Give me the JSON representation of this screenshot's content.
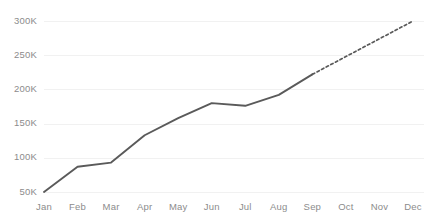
{
  "chart_data": {
    "type": "line",
    "title": "",
    "subtitle": "",
    "xlabel": "",
    "ylabel": "",
    "grid": true,
    "legend": "none",
    "categories": [
      "Jan",
      "Feb",
      "Mar",
      "Apr",
      "May",
      "Jun",
      "Jul",
      "Aug",
      "Sep",
      "Oct",
      "Nov",
      "Dec"
    ],
    "ylim": [
      50000,
      300000
    ],
    "y_ticks": [
      50000,
      100000,
      150000,
      200000,
      250000,
      300000
    ],
    "y_tick_labels": [
      "50K",
      "100K",
      "150K",
      "200K",
      "250K",
      "300K"
    ],
    "x_tick_labels": [
      "Jan",
      "Feb",
      "Mar",
      "Apr",
      "May",
      "Jun",
      "Jul",
      "Aug",
      "Sep",
      "Oct",
      "Nov",
      "Dec"
    ],
    "series": [
      {
        "name": "Actual",
        "style": "solid",
        "color": "#5a5a5a",
        "x": [
          "Jan",
          "Feb",
          "Mar",
          "Apr",
          "May",
          "Jun",
          "Jul",
          "Aug",
          "Sep"
        ],
        "values": [
          50000,
          87000,
          93000,
          133000,
          158000,
          180000,
          176000,
          192000,
          222000
        ]
      },
      {
        "name": "Forecast",
        "style": "dashed",
        "color": "#5a5a5a",
        "x": [
          "Sep",
          "Oct",
          "Nov",
          "Dec"
        ],
        "values": [
          222000,
          248000,
          274000,
          300000
        ]
      }
    ],
    "colors": {
      "line": "#5a5a5a",
      "gridline": "#f1f1f1",
      "tick_label": "#8c8c8c",
      "background": "#ffffff"
    }
  }
}
